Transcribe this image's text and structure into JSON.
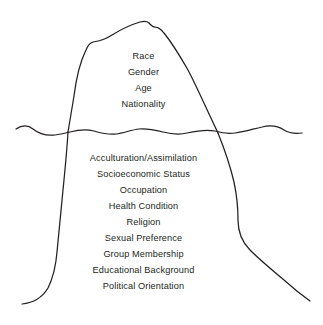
{
  "diagram": {
    "type": "iceberg",
    "stroke_color": "#231f20",
    "background_color": "#ffffff",
    "waterline_label": "waterline"
  },
  "above_water": {
    "region_name": "visible-above-water",
    "items": [
      {
        "label": "Race"
      },
      {
        "label": "Gender"
      },
      {
        "label": "Age"
      },
      {
        "label": "Nationality"
      }
    ]
  },
  "below_water": {
    "region_name": "hidden-below-water",
    "items": [
      {
        "label": "Acculturation/Assimilation"
      },
      {
        "label": "Socioeconomic Status"
      },
      {
        "label": "Occupation"
      },
      {
        "label": "Health Condition"
      },
      {
        "label": "Religion"
      },
      {
        "label": "Sexual Preference"
      },
      {
        "label": "Group Membership"
      },
      {
        "label": "Educational Background"
      },
      {
        "label": "Political Orientation"
      }
    ]
  }
}
